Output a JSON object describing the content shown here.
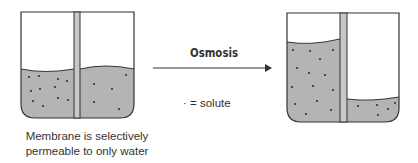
{
  "diagram": {
    "process_label": "Osmosis",
    "legend": "· = solute",
    "caption_line1": "Membrane is selectively",
    "caption_line2": "permeable to only water",
    "colors": {
      "solution_fill": "#b4b4b4",
      "outline": "#333333",
      "membrane_fill": "#c8c8c8",
      "solute_dot": "#333333"
    },
    "before": {
      "left_compartment": {
        "solute_count": 11,
        "level": "equal"
      },
      "right_compartment": {
        "solute_count": 5,
        "level": "equal"
      }
    },
    "after": {
      "left_compartment": {
        "solute_count": 14,
        "level": "high"
      },
      "right_compartment": {
        "solute_count": 5,
        "level": "low"
      }
    }
  }
}
